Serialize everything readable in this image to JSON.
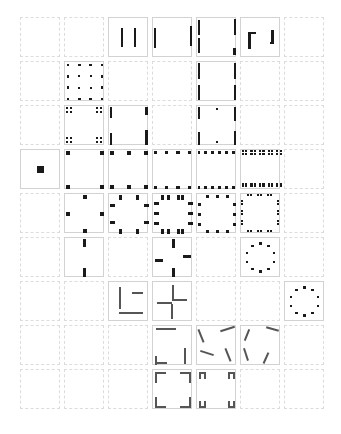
{
  "figure": {
    "canvas": {
      "width": 341,
      "height": 434,
      "background": "#ffffff"
    },
    "grid": {
      "columns": 7,
      "rows": 9,
      "origin_x": 20,
      "origin_y": 17,
      "cell_size": 40,
      "pitch": 44,
      "empty_cell_border_color": "#dcdcdc",
      "empty_cell_border_style": "dashed",
      "active_cell_border_color": "#d2d2d2",
      "active_cell_border_style": "solid",
      "mark_color": "#1a1a1a",
      "segment_color": "#555555"
    },
    "cells": [
      {
        "row": 0,
        "col": 0,
        "state": "empty",
        "motif": "none"
      },
      {
        "row": 0,
        "col": 1,
        "state": "empty",
        "motif": "none"
      },
      {
        "row": 0,
        "col": 2,
        "state": "active",
        "motif": "two-inner-vertical-bars"
      },
      {
        "row": 0,
        "col": 3,
        "state": "active",
        "motif": "two-edge-vertical-bars"
      },
      {
        "row": 0,
        "col": 4,
        "state": "active",
        "motif": "offset-corner-vertical-bars"
      },
      {
        "row": 0,
        "col": 5,
        "state": "active",
        "motif": "corner-hook-and-bar"
      },
      {
        "row": 0,
        "col": 6,
        "state": "empty",
        "motif": "none"
      },
      {
        "row": 1,
        "col": 0,
        "state": "empty",
        "motif": "none"
      },
      {
        "row": 1,
        "col": 1,
        "state": "active",
        "motif": "dot-lattice-4x4"
      },
      {
        "row": 1,
        "col": 2,
        "state": "empty",
        "motif": "none"
      },
      {
        "row": 1,
        "col": 3,
        "state": "empty",
        "motif": "none"
      },
      {
        "row": 1,
        "col": 4,
        "state": "active",
        "motif": "vertical-edge-bars"
      },
      {
        "row": 1,
        "col": 5,
        "state": "empty",
        "motif": "none"
      },
      {
        "row": 1,
        "col": 6,
        "state": "empty",
        "motif": "none"
      },
      {
        "row": 2,
        "col": 0,
        "state": "empty",
        "motif": "none"
      },
      {
        "row": 2,
        "col": 1,
        "state": "active",
        "motif": "corner-dot-clusters"
      },
      {
        "row": 2,
        "col": 2,
        "state": "active",
        "motif": "corner-bars-vertical"
      },
      {
        "row": 2,
        "col": 3,
        "state": "empty",
        "motif": "none"
      },
      {
        "row": 2,
        "col": 4,
        "state": "active",
        "motif": "corner-bars-plus-mid-dots"
      },
      {
        "row": 2,
        "col": 5,
        "state": "empty",
        "motif": "none"
      },
      {
        "row": 2,
        "col": 6,
        "state": "empty",
        "motif": "none"
      },
      {
        "row": 3,
        "col": 0,
        "state": "active",
        "motif": "single-center-square"
      },
      {
        "row": 3,
        "col": 1,
        "state": "active",
        "motif": "corner-squares-4"
      },
      {
        "row": 3,
        "col": 2,
        "state": "active",
        "motif": "edge-dots-3-per-side"
      },
      {
        "row": 3,
        "col": 3,
        "state": "active",
        "motif": "edge-dots-4-per-side"
      },
      {
        "row": 3,
        "col": 4,
        "state": "active",
        "motif": "edge-dots-6-per-side"
      },
      {
        "row": 3,
        "col": 5,
        "state": "active",
        "motif": "edge-dots-dense"
      },
      {
        "row": 3,
        "col": 6,
        "state": "empty",
        "motif": "none"
      },
      {
        "row": 4,
        "col": 0,
        "state": "empty",
        "motif": "none"
      },
      {
        "row": 4,
        "col": 1,
        "state": "active",
        "motif": "edge-midpoint-squares"
      },
      {
        "row": 4,
        "col": 2,
        "state": "active",
        "motif": "edge-pairs-bars"
      },
      {
        "row": 4,
        "col": 3,
        "state": "active",
        "motif": "edge-pairs-bars-wide"
      },
      {
        "row": 4,
        "col": 4,
        "state": "active",
        "motif": "edge-triples-dots"
      },
      {
        "row": 4,
        "col": 5,
        "state": "active",
        "motif": "edge-triples-dense"
      },
      {
        "row": 4,
        "col": 6,
        "state": "empty",
        "motif": "none"
      },
      {
        "row": 5,
        "col": 0,
        "state": "empty",
        "motif": "none"
      },
      {
        "row": 5,
        "col": 1,
        "state": "active",
        "motif": "two-vertical-mid-bars"
      },
      {
        "row": 5,
        "col": 2,
        "state": "empty",
        "motif": "none"
      },
      {
        "row": 5,
        "col": 3,
        "state": "active",
        "motif": "pinwheel-bars"
      },
      {
        "row": 5,
        "col": 4,
        "state": "empty",
        "motif": "none"
      },
      {
        "row": 5,
        "col": 5,
        "state": "active",
        "motif": "dot-ring-circular"
      },
      {
        "row": 5,
        "col": 6,
        "state": "empty",
        "motif": "none"
      },
      {
        "row": 6,
        "col": 0,
        "state": "empty",
        "motif": "none"
      },
      {
        "row": 6,
        "col": 1,
        "state": "empty",
        "motif": "none"
      },
      {
        "row": 6,
        "col": 2,
        "state": "active",
        "motif": "L-shape-corner"
      },
      {
        "row": 6,
        "col": 3,
        "state": "active",
        "motif": "pinwheel-cross"
      },
      {
        "row": 6,
        "col": 4,
        "state": "empty",
        "motif": "none"
      },
      {
        "row": 6,
        "col": 5,
        "state": "empty",
        "motif": "none"
      },
      {
        "row": 6,
        "col": 6,
        "state": "active",
        "motif": "dot-ring-circular"
      },
      {
        "row": 7,
        "col": 0,
        "state": "empty",
        "motif": "none"
      },
      {
        "row": 7,
        "col": 1,
        "state": "empty",
        "motif": "none"
      },
      {
        "row": 7,
        "col": 2,
        "state": "empty",
        "motif": "none"
      },
      {
        "row": 7,
        "col": 3,
        "state": "active",
        "motif": "opposed-edge-segments"
      },
      {
        "row": 7,
        "col": 4,
        "state": "active",
        "motif": "tilted-segments-pinwheel"
      },
      {
        "row": 7,
        "col": 5,
        "state": "active",
        "motif": "tilted-segments-pinwheel-b"
      },
      {
        "row": 7,
        "col": 6,
        "state": "empty",
        "motif": "none"
      },
      {
        "row": 8,
        "col": 0,
        "state": "empty",
        "motif": "none"
      },
      {
        "row": 8,
        "col": 1,
        "state": "empty",
        "motif": "none"
      },
      {
        "row": 8,
        "col": 2,
        "state": "empty",
        "motif": "none"
      },
      {
        "row": 8,
        "col": 3,
        "state": "active",
        "motif": "corner-brackets-4"
      },
      {
        "row": 8,
        "col": 4,
        "state": "active",
        "motif": "corner-staples-4"
      },
      {
        "row": 8,
        "col": 5,
        "state": "empty",
        "motif": "none"
      },
      {
        "row": 8,
        "col": 6,
        "state": "empty",
        "motif": "none"
      }
    ]
  }
}
